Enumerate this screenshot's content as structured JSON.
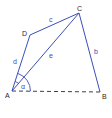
{
  "diagram": {
    "type": "quadrilateral",
    "colors": {
      "line": "#3a4fb8",
      "dashed": "#3a3f4a",
      "point_label": "#2a2a2a",
      "side_label": "#3a4fb8"
    },
    "points": [
      {
        "id": "A",
        "label": "A",
        "x": 12,
        "y": 91
      },
      {
        "id": "B",
        "label": "B",
        "x": 100,
        "y": 92
      },
      {
        "id": "C",
        "label": "C",
        "x": 79,
        "y": 13
      },
      {
        "id": "D",
        "label": "D",
        "x": 30,
        "y": 35
      }
    ],
    "segments": [
      {
        "from": "A",
        "to": "D",
        "label": "d",
        "style": "solid"
      },
      {
        "from": "D",
        "to": "C",
        "label": "c",
        "style": "solid"
      },
      {
        "from": "C",
        "to": "B",
        "label": "b",
        "style": "solid"
      },
      {
        "from": "A",
        "to": "C",
        "label": "e",
        "style": "solid"
      },
      {
        "from": "A",
        "to": "B",
        "label": "",
        "style": "dashed"
      }
    ],
    "angles": [
      {
        "vertex": "A",
        "label": "α"
      }
    ]
  }
}
